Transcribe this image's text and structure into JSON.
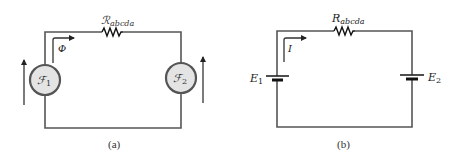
{
  "figure_a": {
    "resistor_label": "ℛ",
    "resistor_subscript": "abcda",
    "flux_label": "Φ",
    "source1_label": "ℱ",
    "source1_subscript": "1",
    "source2_label": "ℱ",
    "source2_subscript": "2",
    "caption": "(a)"
  },
  "figure_b": {
    "resistor_label": "R",
    "resistor_subscript": "abcda",
    "current_label": "I",
    "battery1_label": "E",
    "battery1_subscript": "1",
    "battery2_label": "E",
    "battery2_subscript": "2",
    "caption": "(b)"
  },
  "colors": {
    "wire": "#555555",
    "source_fill": "#e4e4e4",
    "background": "#ffffff"
  }
}
